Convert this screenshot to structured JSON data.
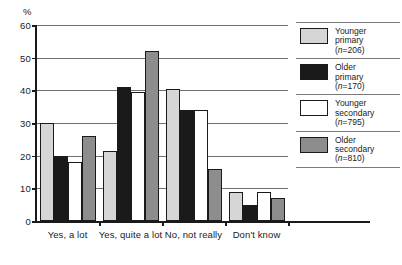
{
  "chart_data": {
    "type": "bar",
    "title": "",
    "xlabel": "",
    "ylabel": "%",
    "ylim": [
      0,
      60
    ],
    "yticks": [
      0,
      10,
      20,
      30,
      40,
      50,
      60
    ],
    "grid": true,
    "legend_position": "right",
    "categories": [
      "Yes, a lot",
      "Yes, quite a lot",
      "No, not really",
      "Don't know"
    ],
    "series": [
      {
        "name": "Younger primary",
        "n": 206,
        "color": "#d6d6d6",
        "values": [
          30,
          21.5,
          40.5,
          9
        ]
      },
      {
        "name": "Older primary",
        "n": 170,
        "color": "#1a1a1a",
        "values": [
          20,
          41,
          34,
          5
        ]
      },
      {
        "name": "Younger secondary",
        "n": 795,
        "color": "#ffffff",
        "values": [
          18,
          39.5,
          34,
          9
        ]
      },
      {
        "name": "Older secondary",
        "n": 810,
        "color": "#8d8d8d",
        "values": [
          26,
          52,
          16,
          7
        ]
      }
    ]
  },
  "axis": {
    "unit_label": "%",
    "tick_labels": [
      "0",
      "10",
      "20",
      "30",
      "40",
      "50",
      "60"
    ]
  },
  "legend": {
    "entries": [
      {
        "line1": "Younger",
        "line2": "primary",
        "line3_pre": "(",
        "line3_n": "n",
        "line3_post": "=206)",
        "swatch": "#d6d6d6"
      },
      {
        "line1": "Older",
        "line2": "primary",
        "line3_pre": "(",
        "line3_n": "n",
        "line3_post": "=170)",
        "swatch": "#1a1a1a"
      },
      {
        "line1": "Younger",
        "line2": "secondary",
        "line3_pre": "(",
        "line3_n": "n",
        "line3_post": "=795)",
        "swatch": "#ffffff"
      },
      {
        "line1": "Older",
        "line2": "secondary",
        "line3_pre": "(",
        "line3_n": "n",
        "line3_post": "=810)",
        "swatch": "#8d8d8d"
      }
    ]
  }
}
